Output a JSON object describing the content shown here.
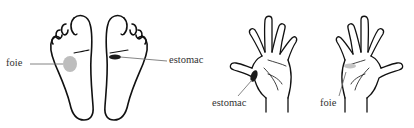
{
  "diagram": {
    "panels": [
      {
        "name": "feet",
        "labels": [
          {
            "text": "foie",
            "target": "left-foot-liver-zone"
          },
          {
            "text": "estomac",
            "target": "right-foot-stomach-zone"
          }
        ]
      },
      {
        "name": "hands",
        "labels": [
          {
            "text": "estomac",
            "target": "left-hand-stomach-zone"
          },
          {
            "text": "foie",
            "target": "right-hand-liver-zone"
          }
        ]
      }
    ],
    "colors": {
      "outline": "#111111",
      "liver_zone": "#bdbdbd",
      "stomach_zone": "#1a1a1a",
      "leader_line": "#777777",
      "text": "#333333"
    }
  }
}
